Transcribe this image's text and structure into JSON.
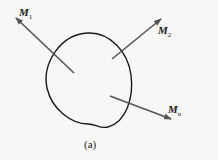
{
  "figure": {
    "caption": "(a)",
    "labels": [
      {
        "id": "m1",
        "base": "M",
        "sub": "1"
      },
      {
        "id": "m2",
        "base": "M",
        "sub": "2"
      },
      {
        "id": "mn",
        "base": "M",
        "sub": "n"
      }
    ],
    "colors": {
      "outline": "#1a1a1a",
      "arrow": "#555555",
      "background": "#f7f7f5"
    }
  }
}
